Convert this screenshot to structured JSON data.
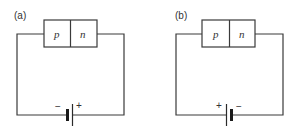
{
  "figure": {
    "panels": [
      {
        "label": "(a)",
        "junction": {
          "left_region": "p",
          "right_region": "n"
        },
        "battery": {
          "left_terminal": "−",
          "right_terminal": "+"
        }
      },
      {
        "label": "(b)",
        "junction": {
          "left_region": "p",
          "right_region": "n"
        },
        "battery": {
          "left_terminal": "+",
          "right_terminal": "−"
        }
      }
    ],
    "colors": {
      "line": "#3a3a3a",
      "background": "#ffffff"
    }
  }
}
